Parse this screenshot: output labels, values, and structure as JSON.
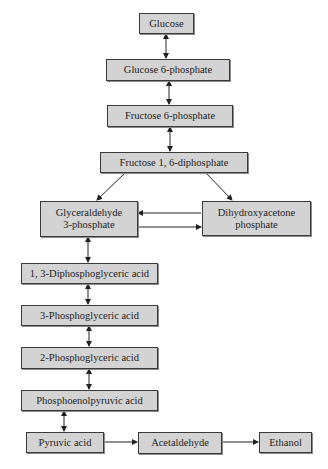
{
  "diagram": {
    "colors": {
      "box_fill": "#d3d3d3",
      "box_border": "#3a3a3a",
      "arrow": "#222222"
    },
    "nodes": [
      {
        "id": "glucose",
        "label": "Glucose"
      },
      {
        "id": "glucose6p",
        "label": "Glucose 6-phosphate"
      },
      {
        "id": "fructose6p",
        "label": "Fructose 6-phosphate"
      },
      {
        "id": "fructose16dp",
        "label": "Fructose 1, 6-diphosphate"
      },
      {
        "id": "g3p",
        "label": "Glyceraldehyde\n3-phosphate"
      },
      {
        "id": "dhap",
        "label": "Dihydroxyacetone\nphosphate"
      },
      {
        "id": "dpg13",
        "label": "1, 3-Diphosphoglyceric acid"
      },
      {
        "id": "pg3",
        "label": "3-Phosphoglyceric acid"
      },
      {
        "id": "pg2",
        "label": "2-Phosphoglyceric acid"
      },
      {
        "id": "pep",
        "label": "Phosphoenolpyruvic acid"
      },
      {
        "id": "pyruvate",
        "label": "Pyruvic acid"
      },
      {
        "id": "acetaldehyde",
        "label": "Acetaldehyde"
      },
      {
        "id": "ethanol",
        "label": "Ethanol"
      }
    ],
    "edges": [
      {
        "from": "glucose",
        "to": "glucose6p",
        "type": "bidirectional"
      },
      {
        "from": "glucose6p",
        "to": "fructose6p",
        "type": "bidirectional"
      },
      {
        "from": "fructose6p",
        "to": "fructose16dp",
        "type": "bidirectional"
      },
      {
        "from": "fructose16dp",
        "to": "g3p",
        "type": "forward"
      },
      {
        "from": "fructose16dp",
        "to": "dhap",
        "type": "forward"
      },
      {
        "from": "dhap",
        "to": "g3p",
        "type": "forward"
      },
      {
        "from": "g3p",
        "to": "dhap",
        "type": "forward"
      },
      {
        "from": "g3p",
        "to": "dpg13",
        "type": "bidirectional"
      },
      {
        "from": "dpg13",
        "to": "pg3",
        "type": "bidirectional"
      },
      {
        "from": "pg3",
        "to": "pg2",
        "type": "bidirectional"
      },
      {
        "from": "pg2",
        "to": "pep",
        "type": "bidirectional"
      },
      {
        "from": "pep",
        "to": "pyruvate",
        "type": "bidirectional"
      },
      {
        "from": "pyruvate",
        "to": "acetaldehyde",
        "type": "forward"
      },
      {
        "from": "acetaldehyde",
        "to": "ethanol",
        "type": "forward"
      }
    ]
  }
}
